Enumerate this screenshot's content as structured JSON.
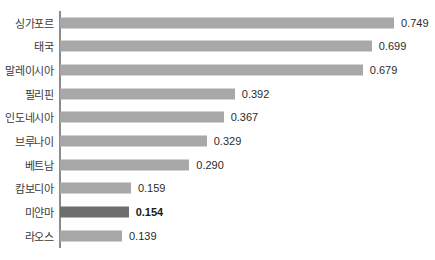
{
  "chart_data": {
    "type": "bar",
    "orientation": "horizontal",
    "title": "",
    "subtitle": "",
    "xlabel": "",
    "ylabel": "",
    "grid": false,
    "legend": null,
    "xlim": [
      0,
      0.84
    ],
    "axis_line": true,
    "categories": [
      "싱가포르",
      "태국",
      "말레이시아",
      "필리핀",
      "인도네시아",
      "브루나이",
      "베트남",
      "캄보디아",
      "미얀마",
      "라오스"
    ],
    "values": [
      0.749,
      0.699,
      0.679,
      0.392,
      0.367,
      0.329,
      0.29,
      0.159,
      0.154,
      0.139
    ],
    "value_labels": [
      "0.749",
      "0.699",
      "0.679",
      "0.392",
      "0.367",
      "0.329",
      "0.290",
      "0.159",
      "0.154",
      "0.139"
    ],
    "highlight_index": 8,
    "bar_color": "#a8a8a8",
    "highlight_color": "#6e6e6e",
    "label_color": "#3a3a3a",
    "value_color": "#2b2b2b",
    "axis_color": "#8c8c8c",
    "background": "#ffffff"
  }
}
